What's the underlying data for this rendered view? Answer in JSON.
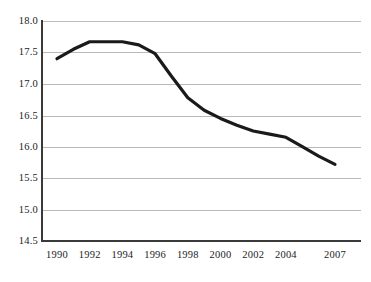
{
  "chart_data": {
    "type": "line",
    "title": "",
    "subtitle": "",
    "xlabel": "",
    "ylabel": "",
    "x": [
      1990,
      1991,
      1992,
      1993,
      1994,
      1995,
      1996,
      1997,
      1998,
      1999,
      2000,
      2001,
      2002,
      2003,
      2004,
      2005,
      2006,
      2007
    ],
    "series": [
      {
        "name": "",
        "values": [
          17.4,
          17.55,
          17.67,
          17.67,
          17.67,
          17.62,
          17.48,
          17.12,
          16.78,
          16.58,
          16.45,
          16.34,
          16.25,
          16.2,
          16.15,
          16.0,
          15.85,
          15.72
        ]
      }
    ],
    "xlim": [
      1990,
      2007
    ],
    "ylim": [
      14.5,
      18.0
    ],
    "ytick_values": [
      18.0,
      17.5,
      17.0,
      16.5,
      16.0,
      15.5,
      15.0,
      14.5
    ],
    "ytick_labels": [
      "18.0",
      "17.5",
      "17.0",
      "16.5",
      "16.0",
      "15.5",
      "15.0",
      "14.5"
    ],
    "xtick_values": [
      1990,
      1992,
      1994,
      1996,
      1998,
      2000,
      2002,
      2004,
      2007
    ],
    "xtick_labels": [
      "1990",
      "1992",
      "1994",
      "1996",
      "1998",
      "2000",
      "2002",
      "2004",
      "2007"
    ],
    "grid": "horizontal",
    "legend": "none",
    "line_color": "#1a1a1a",
    "grid_color": "#b9b9b9",
    "axis_color": "#3a3a3a",
    "background_color": "#ffffff",
    "annotations": []
  }
}
